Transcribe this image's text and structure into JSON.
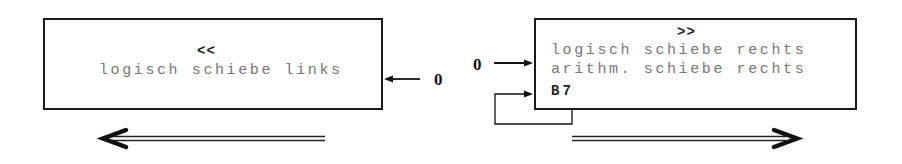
{
  "left_block": {
    "operator": "<<",
    "lines": [
      "logisch schiebe links"
    ],
    "input_label": "0"
  },
  "right_block": {
    "operator": ">>",
    "lines": [
      "logisch schiebe rechts",
      "arithm. schiebe rechts"
    ],
    "feedback_label": "B7",
    "input_label": "0"
  },
  "shift_direction": {
    "left": "left",
    "right": "right"
  }
}
